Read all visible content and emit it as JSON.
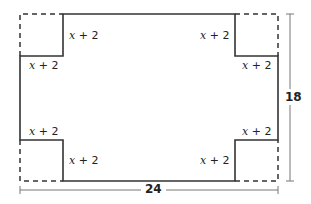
{
  "figure": {
    "outer_width_label": "24",
    "outer_height_label": "18",
    "cutout_side_label": "x + 2",
    "labels": {
      "top_left_vertical": {
        "var": "x",
        "rest": " + 2"
      },
      "top_left_horizontal": {
        "var": "x",
        "rest": " + 2"
      },
      "top_right_vertical": {
        "var": "x",
        "rest": " + 2"
      },
      "top_right_horizontal": {
        "var": "x",
        "rest": " + 2"
      },
      "bottom_left_horizontal": {
        "var": "x",
        "rest": " + 2"
      },
      "bottom_left_vertical": {
        "var": "x",
        "rest": " + 2"
      },
      "bottom_right_horizontal": {
        "var": "x",
        "rest": " + 2"
      },
      "bottom_right_vertical": {
        "var": "x",
        "rest": " + 2"
      }
    },
    "colors": {
      "stroke": "#333333",
      "dimension_line": "#777777",
      "background": "#ffffff"
    }
  }
}
